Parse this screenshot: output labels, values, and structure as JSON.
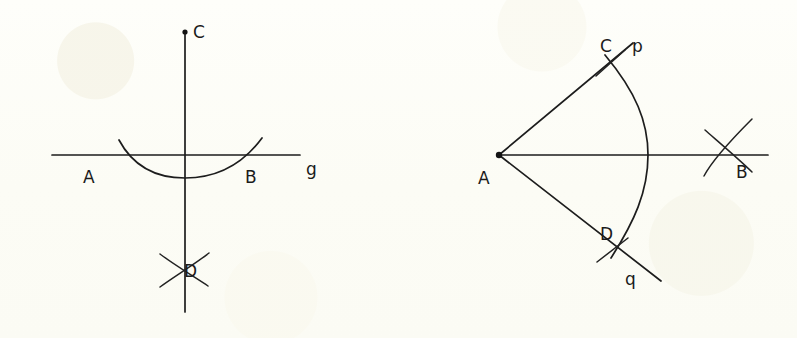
{
  "figure": {
    "background_color": "#fdfdf7",
    "ink_color": "#1d1d1d",
    "width": 797,
    "height": 338
  },
  "left_diagram": {
    "name": "perpendicular-bisector-construction",
    "labels": {
      "point_c": "C",
      "point_a": "A",
      "point_b": "B",
      "point_d": "D",
      "line_g": "g"
    }
  },
  "right_diagram": {
    "name": "angle-bisector-construction",
    "labels": {
      "point_a": "A",
      "point_b": "B",
      "point_c": "C",
      "point_d": "D",
      "ray_p": "p",
      "ray_q": "q"
    }
  }
}
